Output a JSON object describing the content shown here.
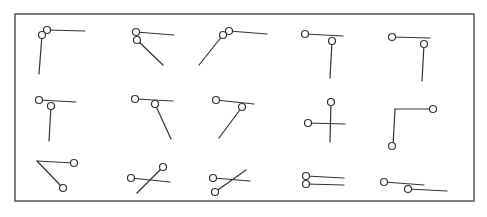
{
  "diagram": {
    "frame": {
      "x": 15,
      "y": 14,
      "width": 459,
      "height": 187
    },
    "colors": {
      "stroke": "#333333",
      "frame": "#555555",
      "background": "#ffffff"
    },
    "node_radius": 3.5,
    "glyphs": [
      {
        "id": 1,
        "row": 1,
        "col": 1,
        "nodes": [
          [
            47,
            30
          ],
          [
            42,
            35
          ]
        ],
        "segments": [
          [
            [
              47,
              30
            ],
            [
              85,
              31
            ]
          ],
          [
            [
              42,
              35
            ],
            [
              39,
              74
            ]
          ]
        ]
      },
      {
        "id": 2,
        "row": 1,
        "col": 2,
        "nodes": [
          [
            136,
            32
          ],
          [
            137,
            40
          ]
        ],
        "segments": [
          [
            [
              136,
              32
            ],
            [
              174,
              35
            ]
          ],
          [
            [
              137,
              40
            ],
            [
              163,
              65
            ]
          ]
        ]
      },
      {
        "id": 3,
        "row": 1,
        "col": 3,
        "nodes": [
          [
            229,
            31
          ],
          [
            223,
            35
          ]
        ],
        "segments": [
          [
            [
              229,
              31
            ],
            [
              267,
              34
            ]
          ],
          [
            [
              223,
              35
            ],
            [
              199,
              65
            ]
          ]
        ]
      },
      {
        "id": 4,
        "row": 1,
        "col": 4,
        "nodes": [
          [
            305,
            34
          ],
          [
            332,
            41
          ]
        ],
        "segments": [
          [
            [
              305,
              34
            ],
            [
              343,
              36
            ]
          ],
          [
            [
              332,
              41
            ],
            [
              330,
              78
            ]
          ]
        ]
      },
      {
        "id": 5,
        "row": 1,
        "col": 5,
        "nodes": [
          [
            392,
            37
          ],
          [
            424,
            44
          ]
        ],
        "segments": [
          [
            [
              392,
              37
            ],
            [
              430,
              38
            ]
          ],
          [
            [
              424,
              44
            ],
            [
              422,
              81
            ]
          ]
        ]
      },
      {
        "id": 6,
        "row": 2,
        "col": 1,
        "nodes": [
          [
            39,
            100
          ],
          [
            51,
            106
          ]
        ],
        "segments": [
          [
            [
              39,
              100
            ],
            [
              76,
              102
            ]
          ],
          [
            [
              51,
              106
            ],
            [
              49,
              141
            ]
          ]
        ]
      },
      {
        "id": 7,
        "row": 2,
        "col": 2,
        "nodes": [
          [
            135,
            99
          ],
          [
            155,
            104
          ]
        ],
        "segments": [
          [
            [
              135,
              99
            ],
            [
              173,
              101
            ]
          ],
          [
            [
              155,
              104
            ],
            [
              171,
              139
            ]
          ]
        ]
      },
      {
        "id": 8,
        "row": 2,
        "col": 3,
        "nodes": [
          [
            216,
            100
          ],
          [
            242,
            107
          ]
        ],
        "segments": [
          [
            [
              216,
              100
            ],
            [
              254,
              104
            ]
          ],
          [
            [
              242,
              107
            ],
            [
              219,
              138
            ]
          ]
        ]
      },
      {
        "id": 9,
        "row": 2,
        "col": 4,
        "nodes": [
          [
            331,
            102
          ],
          [
            308,
            123
          ]
        ],
        "segments": [
          [
            [
              331,
              102
            ],
            [
              330,
              142
            ]
          ],
          [
            [
              308,
              123
            ],
            [
              345,
              124
            ]
          ]
        ]
      },
      {
        "id": 10,
        "row": 2,
        "col": 5,
        "nodes": [
          [
            433,
            109
          ],
          [
            392,
            146
          ]
        ],
        "segments": [
          [
            [
              433,
              109
            ],
            [
              395,
              109
            ]
          ],
          [
            [
              395,
              109
            ],
            [
              393,
              146
            ]
          ]
        ]
      },
      {
        "id": 11,
        "row": 3,
        "col": 1,
        "nodes": [
          [
            74,
            163
          ],
          [
            63,
            188
          ]
        ],
        "segments": [
          [
            [
              37,
              161
            ],
            [
              74,
              163
            ]
          ],
          [
            [
              37,
              161
            ],
            [
              63,
              188
            ]
          ]
        ]
      },
      {
        "id": 12,
        "row": 3,
        "col": 2,
        "nodes": [
          [
            131,
            178
          ],
          [
            163,
            167
          ]
        ],
        "segments": [
          [
            [
              131,
              178
            ],
            [
              170,
              182
            ]
          ],
          [
            [
              163,
              167
            ],
            [
              137,
              193
            ]
          ]
        ]
      },
      {
        "id": 13,
        "row": 3,
        "col": 3,
        "nodes": [
          [
            213,
            178
          ],
          [
            215,
            192
          ]
        ],
        "segments": [
          [
            [
              213,
              178
            ],
            [
              250,
              181
            ]
          ],
          [
            [
              246,
              170
            ],
            [
              215,
              192
            ]
          ]
        ]
      },
      {
        "id": 14,
        "row": 3,
        "col": 4,
        "nodes": [
          [
            306,
            176
          ],
          [
            306,
            184
          ]
        ],
        "segments": [
          [
            [
              306,
              176
            ],
            [
              344,
              178
            ]
          ],
          [
            [
              306,
              184
            ],
            [
              344,
              185
            ]
          ]
        ]
      },
      {
        "id": 15,
        "row": 3,
        "col": 5,
        "nodes": [
          [
            384,
            182
          ],
          [
            408,
            189
          ]
        ],
        "segments": [
          [
            [
              384,
              182
            ],
            [
              424,
              185
            ]
          ],
          [
            [
              408,
              189
            ],
            [
              447,
              191
            ]
          ]
        ]
      }
    ]
  }
}
